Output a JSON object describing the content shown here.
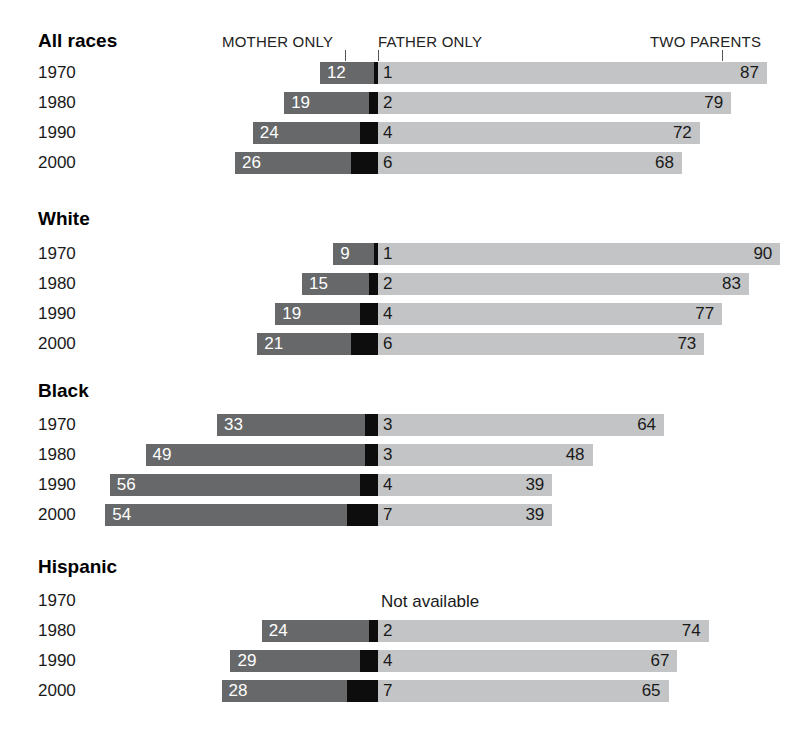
{
  "legend": {
    "mother": "MOTHER ONLY",
    "father": "FATHER ONLY",
    "two": "TWO PARENTS",
    "not_available": "Not available"
  },
  "colors": {
    "mother_only": "#666869",
    "father_only": "#0d0d0d",
    "two_parents": "#c3c4c5",
    "background": "#ffffff",
    "text": "#1a1a1a"
  },
  "groups": [
    {
      "title": "All races",
      "rows": [
        {
          "year": "1970",
          "mother": 12,
          "father": 1,
          "two": 87,
          "available": true
        },
        {
          "year": "1980",
          "mother": 19,
          "father": 2,
          "two": 79,
          "available": true
        },
        {
          "year": "1990",
          "mother": 24,
          "father": 4,
          "two": 72,
          "available": true
        },
        {
          "year": "2000",
          "mother": 26,
          "father": 6,
          "two": 68,
          "available": true
        }
      ]
    },
    {
      "title": "White",
      "rows": [
        {
          "year": "1970",
          "mother": 9,
          "father": 1,
          "two": 90,
          "available": true
        },
        {
          "year": "1980",
          "mother": 15,
          "father": 2,
          "two": 83,
          "available": true
        },
        {
          "year": "1990",
          "mother": 19,
          "father": 4,
          "two": 77,
          "available": true
        },
        {
          "year": "2000",
          "mother": 21,
          "father": 6,
          "two": 73,
          "available": true
        }
      ]
    },
    {
      "title": "Black",
      "rows": [
        {
          "year": "1970",
          "mother": 33,
          "father": 3,
          "two": 64,
          "available": true
        },
        {
          "year": "1980",
          "mother": 49,
          "father": 3,
          "two": 48,
          "available": true
        },
        {
          "year": "1990",
          "mother": 56,
          "father": 4,
          "two": 39,
          "available": true
        },
        {
          "year": "2000",
          "mother": 54,
          "father": 7,
          "two": 39,
          "available": true
        }
      ]
    },
    {
      "title": "Hispanic",
      "rows": [
        {
          "year": "1970",
          "mother": null,
          "father": null,
          "two": null,
          "available": false
        },
        {
          "year": "1980",
          "mother": 24,
          "father": 2,
          "two": 74,
          "available": true
        },
        {
          "year": "1990",
          "mother": 29,
          "father": 4,
          "two": 67,
          "available": true
        },
        {
          "year": "2000",
          "mother": 28,
          "father": 7,
          "two": 65,
          "available": true
        }
      ]
    }
  ],
  "chart_data": {
    "type": "bar",
    "title": "",
    "subtype": "diverging-stacked-bar",
    "xlabel": "",
    "ylabel": "",
    "units": "percent",
    "categories": [
      "1970",
      "1980",
      "1990",
      "2000"
    ],
    "legend_entries": [
      "MOTHER ONLY",
      "FATHER ONLY",
      "TWO PARENTS"
    ],
    "legend_position": "top",
    "grid": false,
    "panels": [
      {
        "name": "All races",
        "series": [
          {
            "name": "MOTHER ONLY",
            "values": [
              12,
              19,
              24,
              26
            ]
          },
          {
            "name": "FATHER ONLY",
            "values": [
              1,
              2,
              4,
              6
            ]
          },
          {
            "name": "TWO PARENTS",
            "values": [
              87,
              79,
              72,
              68
            ]
          }
        ]
      },
      {
        "name": "White",
        "series": [
          {
            "name": "MOTHER ONLY",
            "values": [
              9,
              15,
              19,
              21
            ]
          },
          {
            "name": "FATHER ONLY",
            "values": [
              1,
              2,
              4,
              6
            ]
          },
          {
            "name": "TWO PARENTS",
            "values": [
              90,
              83,
              77,
              73
            ]
          }
        ]
      },
      {
        "name": "Black",
        "series": [
          {
            "name": "MOTHER ONLY",
            "values": [
              33,
              49,
              56,
              54
            ]
          },
          {
            "name": "FATHER ONLY",
            "values": [
              3,
              3,
              4,
              7
            ]
          },
          {
            "name": "TWO PARENTS",
            "values": [
              64,
              48,
              39,
              39
            ]
          }
        ]
      },
      {
        "name": "Hispanic",
        "series": [
          {
            "name": "MOTHER ONLY",
            "values": [
              null,
              24,
              29,
              28
            ]
          },
          {
            "name": "FATHER ONLY",
            "values": [
              null,
              2,
              4,
              7
            ]
          },
          {
            "name": "TWO PARENTS",
            "values": [
              null,
              74,
              67,
              65
            ]
          }
        ]
      }
    ],
    "annotations": [
      {
        "panel": "Hispanic",
        "category": "1970",
        "text": "Not available"
      }
    ]
  }
}
